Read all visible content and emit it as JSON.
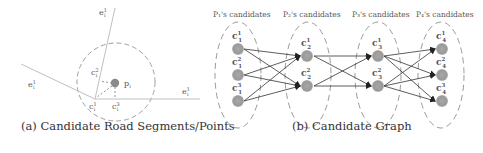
{
  "panel_a": {
    "caption": "(a) Candidate Road Segments/Points",
    "labels": {
      "e1": "e",
      "e1_sup": "1",
      "e1_sub": "i",
      "e2": "e",
      "e2_sup": "1",
      "e2_sub": "i",
      "e3": "e",
      "e3_sup": "1",
      "e3_sub": "i",
      "c_a": "c",
      "c_a_sup": "2",
      "c_a_sub": "i",
      "c_b": "c",
      "c_b_sup": "1",
      "c_b_sub": "i",
      "c_c": "c",
      "c_c_sup": "3",
      "c_c_sub": "i",
      "p": "p",
      "p_sub": "i"
    },
    "colors": {
      "line": "#c8c8c8",
      "circle": "#a0a0a0",
      "point": "#8a8a8a"
    }
  },
  "panel_b": {
    "caption": "(b) Candidate Graph",
    "columns": [
      {
        "header": "P₁'s candidates",
        "nodes": [
          {
            "label": "c",
            "sup": "1",
            "sub": "1"
          },
          {
            "label": "c",
            "sup": "2",
            "sub": "1"
          },
          {
            "label": "c",
            "sup": "3",
            "sub": "1"
          }
        ]
      },
      {
        "header": "P₂'s candidates",
        "nodes": [
          {
            "label": "c",
            "sup": "1",
            "sub": "2"
          },
          {
            "label": "c",
            "sup": "2",
            "sub": "2"
          }
        ]
      },
      {
        "header": "P₃'s candidates",
        "nodes": [
          {
            "label": "c",
            "sup": "1",
            "sub": "3"
          },
          {
            "label": "c",
            "sup": "2",
            "sub": "3"
          }
        ]
      },
      {
        "header": "P₄'s candidates",
        "nodes": [
          {
            "label": "c",
            "sup": "1",
            "sub": "4"
          },
          {
            "label": "c",
            "sup": "2",
            "sub": "4"
          },
          {
            "label": "c",
            "sup": "3",
            "sub": "4"
          }
        ]
      }
    ],
    "colors": {
      "node": "#9a9a9a",
      "edge": "#333333",
      "ellipse": "#9a9a9a"
    }
  }
}
